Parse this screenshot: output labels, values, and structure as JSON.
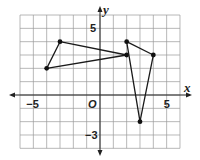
{
  "chart_data": {
    "type": "scatter",
    "title": "",
    "xlabel": "x",
    "ylabel": "y",
    "origin_label": "O",
    "xlim": [
      -6,
      6
    ],
    "ylim": [
      -4,
      6
    ],
    "grid": true,
    "tick_labels": [
      {
        "axis": "x",
        "value": -5,
        "text": "−5"
      },
      {
        "axis": "x",
        "value": 5,
        "text": "5"
      },
      {
        "axis": "y",
        "value": 5,
        "text": "5"
      },
      {
        "axis": "y",
        "value": -3,
        "text": "−3"
      }
    ],
    "polygons": [
      {
        "name": "triangle-left",
        "points": [
          [
            -4,
            2
          ],
          [
            -3,
            4
          ],
          [
            2,
            3
          ]
        ]
      },
      {
        "name": "triangle-right",
        "points": [
          [
            2,
            4
          ],
          [
            4,
            3
          ],
          [
            3,
            -2
          ]
        ]
      }
    ]
  }
}
